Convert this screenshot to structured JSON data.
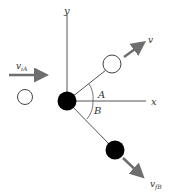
{
  "diagram": {
    "axes": {
      "x_label": "x",
      "y_label": "y"
    },
    "angles": {
      "upper": "A",
      "lower": "B"
    },
    "vectors": {
      "incoming": {
        "main": "v",
        "sub": "iA"
      },
      "outgoing_a": {
        "main": "v",
        "sub": ""
      },
      "outgoing_b": {
        "main": "v",
        "sub": "fB"
      }
    },
    "colors": {
      "arrow": "#6e6e6e",
      "line": "#444444",
      "ball_dark": "#000000",
      "ball_light": "#ffffff"
    }
  }
}
